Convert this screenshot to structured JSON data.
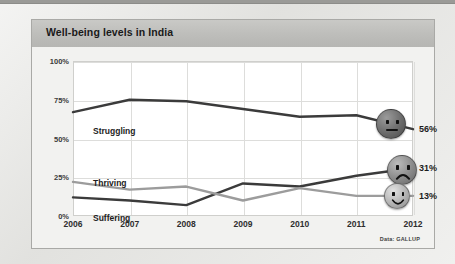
{
  "chart_card": {
    "title": "Well-being levels in India",
    "source_note": "Data: GALLUP"
  },
  "axes": {
    "y_ticks": [
      "0%",
      "25%",
      "50%",
      "75%",
      "100%"
    ],
    "x_ticks": [
      "2006",
      "2007",
      "2008",
      "2009",
      "2010",
      "2011",
      "2012"
    ]
  },
  "series_labels": {
    "struggling": "Struggling",
    "thriving": "Thriving",
    "suffering": "Suffering"
  },
  "end_values": {
    "struggling": "56%",
    "thriving": "31%",
    "suffering": "13%"
  },
  "faces": {
    "struggling": "neutral-face-icon",
    "thriving": "sad-face-icon",
    "suffering": "smiling-face-icon"
  },
  "colors": {
    "struggling_line": "#3b3b3b",
    "thriving_line": "#3b3b3b",
    "suffering_line": "#9c9c9c",
    "panel_background": "#f2f2f0",
    "title_bar": "#bdbdba",
    "plot_background": "#ffffff",
    "gridline": "#dddddb",
    "neutral_face": "#6e6e6e",
    "sad_face": "#8d8d8d",
    "smiling_face": "#b6b6b6"
  },
  "chart_data": {
    "type": "line",
    "title": "Well-being levels in India",
    "xlabel": "",
    "ylabel": "",
    "x": [
      2006,
      2007,
      2008,
      2009,
      2010,
      2011,
      2012
    ],
    "ylim": [
      0,
      100
    ],
    "xlim": [
      2006,
      2012
    ],
    "grid": true,
    "legend": "inline-labels",
    "ytick_values": [
      0,
      25,
      50,
      75,
      100
    ],
    "ytick_labels": [
      "0%",
      "25%",
      "50%",
      "75%",
      "100%"
    ],
    "xtick_labels": [
      "2006",
      "2007",
      "2008",
      "2009",
      "2010",
      "2011",
      "2012"
    ],
    "annotations": [
      "Data: GALLUP"
    ],
    "series": [
      {
        "name": "Struggling",
        "color": "#3b3b3b",
        "values": [
          67,
          75,
          74,
          69,
          64,
          65,
          56
        ],
        "end_label": "56%",
        "marker": "neutral-face-icon"
      },
      {
        "name": "Thriving",
        "color": "#3b3b3b",
        "values": [
          12,
          10,
          7,
          21,
          19,
          26,
          31
        ],
        "end_label": "31%",
        "marker": "sad-face-icon"
      },
      {
        "name": "Suffering",
        "color": "#9c9c9c",
        "values": [
          22,
          17,
          19,
          10,
          18,
          13,
          13
        ],
        "end_label": "13%",
        "marker": "smiling-face-icon"
      }
    ]
  }
}
